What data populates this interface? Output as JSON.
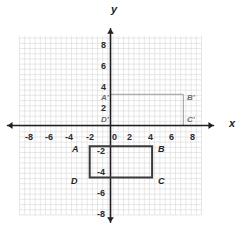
{
  "figure": {
    "type": "coordinate-plane",
    "axis_names": {
      "x": "x",
      "y": "y"
    },
    "x_tick_labels": [
      "-8",
      "-6",
      "-4",
      "-2",
      "0",
      "2",
      "4",
      "6",
      "8"
    ],
    "y_tick_labels": [
      "8",
      "6",
      "4",
      "2",
      "-2",
      "-4",
      "-6",
      "-8"
    ],
    "origin_label": "0"
  },
  "chart_data": {
    "type": "scatter",
    "title": "",
    "xlabel": "x",
    "ylabel": "y",
    "xlim": [
      -9.5,
      9.5
    ],
    "ylim": [
      -9.5,
      9.5
    ],
    "grid": true,
    "grid_minor_step": 0.5,
    "grid_major_step": 2,
    "legend": "none",
    "xticks": [
      -8,
      -6,
      -4,
      -2,
      0,
      2,
      4,
      6,
      8
    ],
    "yticks": [
      -8,
      -6,
      -4,
      -2,
      2,
      4,
      6,
      8
    ],
    "xtick_labels": [
      "-8",
      "-6",
      "-4",
      "-2",
      "0",
      "2",
      "4",
      "6",
      "8"
    ],
    "ytick_labels": [
      "8",
      "6",
      "4",
      "2",
      "-2",
      "-4",
      "-6",
      "-8"
    ],
    "series": [
      {
        "name": "Rectangle ABCD",
        "kind": "polygon",
        "closed": true,
        "stroke": "#3a3a3a",
        "stroke_width": 2.0,
        "fill": "none",
        "points": [
          {
            "label": "A",
            "x": -2,
            "y": -2
          },
          {
            "label": "B",
            "x": 4,
            "y": -2
          },
          {
            "label": "C",
            "x": 4,
            "y": -5
          },
          {
            "label": "D",
            "x": -2,
            "y": -5
          }
        ]
      },
      {
        "name": "Rectangle A'B'C'D'",
        "kind": "polygon",
        "closed": true,
        "stroke": "#9a9a9a",
        "stroke_width": 1.0,
        "fill": "none",
        "points": [
          {
            "label": "A'",
            "x": 0,
            "y": 3
          },
          {
            "label": "B'",
            "x": 7,
            "y": 3
          },
          {
            "label": "C'",
            "x": 7,
            "y": 0
          },
          {
            "label": "D'",
            "x": 0,
            "y": 0
          }
        ]
      }
    ]
  },
  "labels": {
    "a": "A",
    "b": "B",
    "c": "C",
    "d": "D",
    "a_prime": "A'",
    "b_prime": "B'",
    "c_prime": "C'",
    "d_prime": "D'",
    "x_axis": "x",
    "y_axis": "y",
    "x_neg8": "-8",
    "x_neg6": "-6",
    "x_neg4": "-4",
    "x_neg2": "-2",
    "x_zero": "0",
    "x_pos2": "2",
    "x_pos4": "4",
    "x_pos6": "6",
    "x_pos8": "8",
    "y_pos8": "8",
    "y_pos6": "6",
    "y_pos4": "4",
    "y_pos2": "2",
    "y_neg2": "-2",
    "y_neg4": "-4",
    "y_neg6": "-6",
    "y_neg8": "-8"
  },
  "colors": {
    "grid_minor": "#d9d6d9",
    "grid_major": "#9b989b",
    "axis": "#231f20",
    "preimage_stroke": "#3a3a3a",
    "image_stroke": "#9a9a9a",
    "text": "#231f20",
    "background": "#ffffff"
  }
}
